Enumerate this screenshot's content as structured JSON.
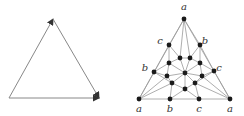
{
  "left_figure": {
    "description": "oriented triangle",
    "vertices": [
      [
        53,
        19
      ],
      [
        9,
        98
      ],
      [
        99,
        98
      ]
    ],
    "arrows": [
      {
        "from": [
          9,
          98
        ],
        "to": [
          53,
          19
        ]
      },
      {
        "from": [
          53,
          19
        ],
        "to": [
          99,
          98
        ]
      },
      {
        "from": [
          9,
          98
        ],
        "to": [
          99,
          98
        ]
      }
    ],
    "stroke": "#888888",
    "arrow_color": "#333333"
  },
  "right_figure": {
    "description": "triangulated graph with labeled corner and edge vertices",
    "node_color": "#1a1a1a",
    "edge_color": "#999999",
    "nodes": [
      {
        "id": "A",
        "x": 184,
        "y": 19
      },
      {
        "id": "CL",
        "x": 169,
        "y": 45
      },
      {
        "id": "BR",
        "x": 200,
        "y": 45
      },
      {
        "id": "T1",
        "x": 180,
        "y": 58
      },
      {
        "id": "T2",
        "x": 190,
        "y": 58
      },
      {
        "id": "M1",
        "x": 169,
        "y": 63
      },
      {
        "id": "M2",
        "x": 200,
        "y": 63
      },
      {
        "id": "BL",
        "x": 154,
        "y": 72
      },
      {
        "id": "CR",
        "x": 214,
        "y": 71
      },
      {
        "id": "C",
        "x": 185,
        "y": 73
      },
      {
        "id": "L1",
        "x": 167,
        "y": 76
      },
      {
        "id": "R1",
        "x": 202,
        "y": 76
      },
      {
        "id": "L2",
        "x": 172,
        "y": 83
      },
      {
        "id": "R2",
        "x": 195,
        "y": 83
      },
      {
        "id": "D",
        "x": 185,
        "y": 89
      },
      {
        "id": "A1",
        "x": 139,
        "y": 99
      },
      {
        "id": "B0",
        "x": 170,
        "y": 99
      },
      {
        "id": "C0",
        "x": 199,
        "y": 99
      },
      {
        "id": "A2",
        "x": 230,
        "y": 99
      }
    ],
    "edges": [
      [
        "A",
        "CL"
      ],
      [
        "A",
        "BR"
      ],
      [
        "A",
        "T1"
      ],
      [
        "A",
        "T2"
      ],
      [
        "A",
        "A1"
      ],
      [
        "A",
        "A2"
      ],
      [
        "CL",
        "BL"
      ],
      [
        "BR",
        "CR"
      ],
      [
        "BL",
        "A1"
      ],
      [
        "CR",
        "A2"
      ],
      [
        "A1",
        "B0"
      ],
      [
        "B0",
        "C0"
      ],
      [
        "C0",
        "A2"
      ],
      [
        "CL",
        "T1"
      ],
      [
        "CL",
        "M1"
      ],
      [
        "BR",
        "T2"
      ],
      [
        "BR",
        "M2"
      ],
      [
        "T1",
        "T2"
      ],
      [
        "T1",
        "M1"
      ],
      [
        "T2",
        "M2"
      ],
      [
        "T1",
        "C"
      ],
      [
        "T2",
        "C"
      ],
      [
        "M1",
        "C"
      ],
      [
        "M2",
        "C"
      ],
      [
        "M1",
        "BL"
      ],
      [
        "M2",
        "CR"
      ],
      [
        "M1",
        "L1"
      ],
      [
        "M2",
        "R1"
      ],
      [
        "BL",
        "L1"
      ],
      [
        "CR",
        "R1"
      ],
      [
        "L1",
        "C"
      ],
      [
        "R1",
        "C"
      ],
      [
        "L1",
        "L2"
      ],
      [
        "R1",
        "R2"
      ],
      [
        "C",
        "L2"
      ],
      [
        "C",
        "R2"
      ],
      [
        "C",
        "D"
      ],
      [
        "L2",
        "D"
      ],
      [
        "R2",
        "D"
      ],
      [
        "BL",
        "L2"
      ],
      [
        "CR",
        "R2"
      ],
      [
        "L2",
        "A1"
      ],
      [
        "L2",
        "B0"
      ],
      [
        "R2",
        "C0"
      ],
      [
        "R2",
        "A2"
      ],
      [
        "D",
        "B0"
      ],
      [
        "D",
        "C0"
      ],
      [
        "L1",
        "A1"
      ],
      [
        "R1",
        "A2"
      ]
    ],
    "labels": [
      {
        "text": "a",
        "x": 184,
        "y": 10
      },
      {
        "text": "c",
        "x": 160,
        "y": 44
      },
      {
        "text": "b",
        "x": 205,
        "y": 44
      },
      {
        "text": "b",
        "x": 145,
        "y": 71
      },
      {
        "text": "c",
        "x": 219,
        "y": 71
      },
      {
        "text": "a",
        "x": 139,
        "y": 112
      },
      {
        "text": "b",
        "x": 170,
        "y": 112
      },
      {
        "text": "c",
        "x": 199,
        "y": 112
      },
      {
        "text": "a",
        "x": 230,
        "y": 112
      }
    ]
  }
}
